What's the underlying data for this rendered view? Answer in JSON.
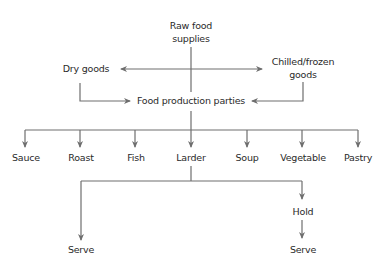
{
  "diagram": {
    "colors": {
      "line": "#6e6e6e",
      "text": "#2a2a2a",
      "background": "#ffffff"
    },
    "nodes": {
      "raw": {
        "line1": "Raw food",
        "line2": "supplies"
      },
      "dry": {
        "label": "Dry goods"
      },
      "chilled": {
        "line1": "Chilled/frozen",
        "line2": "goods"
      },
      "parties": {
        "label": "Food production parties"
      },
      "sections": [
        {
          "label": "Sauce"
        },
        {
          "label": "Roast"
        },
        {
          "label": "Fish"
        },
        {
          "label": "Larder"
        },
        {
          "label": "Soup"
        },
        {
          "label": "Vegetable"
        },
        {
          "label": "Pastry"
        }
      ],
      "serve_left": {
        "label": "Serve"
      },
      "hold": {
        "label": "Hold"
      },
      "serve_right": {
        "label": "Serve"
      }
    },
    "edges": [
      {
        "from": "Raw food supplies",
        "to": "Dry goods"
      },
      {
        "from": "Raw food supplies",
        "to": "Chilled/frozen goods"
      },
      {
        "from": "Raw food supplies",
        "to": "Food production parties"
      },
      {
        "from": "Dry goods",
        "to": "Food production parties"
      },
      {
        "from": "Chilled/frozen goods",
        "to": "Food production parties"
      },
      {
        "from": "Food production parties",
        "to": "Sauce"
      },
      {
        "from": "Food production parties",
        "to": "Roast"
      },
      {
        "from": "Food production parties",
        "to": "Fish"
      },
      {
        "from": "Food production parties",
        "to": "Larder"
      },
      {
        "from": "Food production parties",
        "to": "Soup"
      },
      {
        "from": "Food production parties",
        "to": "Vegetable"
      },
      {
        "from": "Food production parties",
        "to": "Pastry"
      },
      {
        "from": "Larder",
        "to": "Serve"
      },
      {
        "from": "Larder",
        "to": "Hold"
      },
      {
        "from": "Hold",
        "to": "Serve"
      }
    ]
  }
}
